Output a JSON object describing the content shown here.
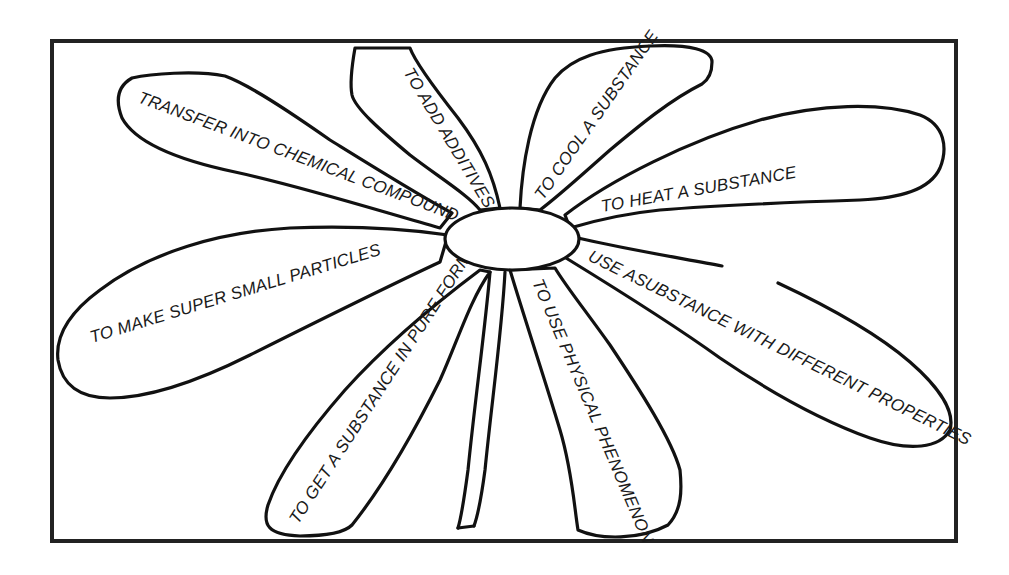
{
  "diagram": {
    "type": "mind-map-flower",
    "center": {
      "label": ""
    },
    "petals": [
      {
        "id": "transfer",
        "label": "TRANSFER INTO CHEMICAL COMPOUND"
      },
      {
        "id": "additives",
        "label": "TO ADD ADDITIVES"
      },
      {
        "id": "cool",
        "label": "TO COOL A SUBSTANCE"
      },
      {
        "id": "heat",
        "label": "TO HEAT A SUBSTANCE"
      },
      {
        "id": "properties",
        "label": "USE ASUBSTANCE WITH DIFFERENT PROPERTIES"
      },
      {
        "id": "physical",
        "label": "TO USE PHYSICAL PHENOMENON"
      },
      {
        "id": "pure",
        "label": "TO GET A SUBSTANCE IN PURE FORM"
      },
      {
        "id": "particles",
        "label": "TO MAKE SUPER SMALL PARTICLES"
      }
    ]
  },
  "colors": {
    "ink": "#111111",
    "background": "#ffffff",
    "frame": "#222222"
  }
}
